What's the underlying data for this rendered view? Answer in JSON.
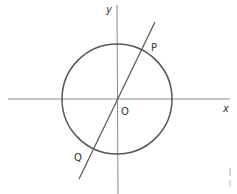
{
  "diagram": {
    "type": "coordinate-circle",
    "axes": {
      "x_label": "x",
      "y_label": "y",
      "origin_label": "O"
    },
    "circle": {
      "center": "O",
      "stroke_color": "#555555"
    },
    "line": {
      "passes_through": "O",
      "points": [
        {
          "label": "P",
          "position": "upper-right intersection with circle"
        },
        {
          "label": "Q",
          "position": "lower-left intersection with circle"
        }
      ],
      "stroke_color": "#555555"
    },
    "colors": {
      "axis": "#888888",
      "circle": "#555555",
      "line": "#555555",
      "label": "#333333",
      "background": "#ffffff"
    }
  }
}
